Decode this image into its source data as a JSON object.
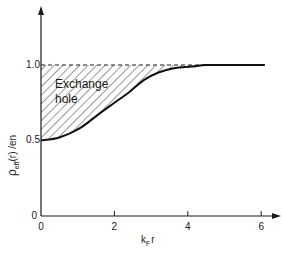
{
  "chart_data": {
    "type": "area",
    "title": "",
    "xlabel": "k_F r",
    "ylabel": "ρ_eff(r)/en",
    "xlim": [
      0,
      6.5
    ],
    "ylim": [
      0,
      1.3
    ],
    "grid": false,
    "legend": null,
    "x_ticks": [
      0,
      2,
      4,
      6
    ],
    "x_tick_labels": [
      "0",
      "2",
      "4",
      "6"
    ],
    "y_ticks": [
      0,
      0.5,
      1.0
    ],
    "y_tick_labels": [
      "0",
      "0.5",
      "1.0"
    ],
    "series": [
      {
        "name": "ρ_eff(r)/en",
        "style": "solid",
        "x": [
          0,
          0.5,
          1.05,
          1.6,
          2.0,
          2.4,
          2.8,
          3.2,
          3.65,
          4.1,
          4.5,
          5.0,
          5.5,
          6.1
        ],
        "values": [
          0.5,
          0.52,
          0.58,
          0.68,
          0.75,
          0.82,
          0.9,
          0.95,
          0.98,
          0.99,
          1.0,
          1.0,
          1.0,
          1.0
        ]
      },
      {
        "name": "reference level",
        "style": "dashed",
        "x": [
          0,
          4.5
        ],
        "values": [
          1.0,
          1.0
        ]
      }
    ],
    "shaded_region": {
      "description": "hatched area between dashed line at 1.0 and curve",
      "fill": "diagonal-hatch"
    },
    "annotations": [
      {
        "text": "Exchange",
        "x": 0.65,
        "y": 0.84
      },
      {
        "text": "hole",
        "x": 0.65,
        "y": 0.72
      }
    ]
  },
  "labels": {
    "xlabel_main": "k",
    "xlabel_sub": "F",
    "xlabel_tail": "r",
    "ylabel_main": "ρ",
    "ylabel_sub": "eff",
    "ylabel_tail": "(r) /en",
    "annot_line1": "Exchange",
    "annot_line2": "hole",
    "xt0": "0",
    "xt2": "2",
    "xt4": "4",
    "xt6": "6",
    "yt0": "0",
    "yt05": "0.5",
    "yt10": "1.0"
  }
}
